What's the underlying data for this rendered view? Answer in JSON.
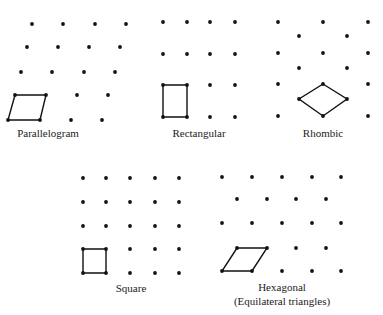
{
  "figure": {
    "panels": [
      {
        "name": "Parallelogram",
        "label": "Parallelogram",
        "label_pos": [
          48,
          137
        ],
        "dots": [
          [
            32,
            24
          ],
          [
            63,
            24
          ],
          [
            95,
            24
          ],
          [
            126,
            24
          ],
          [
            27,
            47
          ],
          [
            58,
            47
          ],
          [
            89,
            47
          ],
          [
            120,
            47
          ],
          [
            21,
            72
          ],
          [
            52,
            72
          ],
          [
            84,
            72
          ],
          [
            115,
            72
          ],
          [
            15,
            95
          ],
          [
            46,
            95
          ],
          [
            77,
            95
          ],
          [
            108,
            95
          ],
          [
            8,
            120
          ],
          [
            40,
            120
          ],
          [
            71,
            120
          ],
          [
            102,
            120
          ]
        ],
        "cell": [
          [
            15,
            95
          ],
          [
            46,
            95
          ],
          [
            40,
            120
          ],
          [
            8,
            120
          ]
        ]
      },
      {
        "name": "Rectangular",
        "label": "Rectangular",
        "label_pos": [
          199,
          137
        ],
        "dots": [
          [
            163,
            22
          ],
          [
            187,
            22
          ],
          [
            210,
            22
          ],
          [
            235,
            22
          ],
          [
            163,
            54
          ],
          [
            187,
            54
          ],
          [
            210,
            54
          ],
          [
            235,
            54
          ],
          [
            163,
            85
          ],
          [
            187,
            85
          ],
          [
            210,
            85
          ],
          [
            235,
            85
          ],
          [
            163,
            117
          ],
          [
            187,
            117
          ],
          [
            210,
            117
          ],
          [
            235,
            117
          ]
        ],
        "cell": [
          [
            163,
            85
          ],
          [
            187,
            85
          ],
          [
            187,
            117
          ],
          [
            163,
            117
          ]
        ]
      },
      {
        "name": "Rhombic",
        "label": "Rhombic",
        "label_pos": [
          323,
          137
        ],
        "dots": [
          [
            278,
            22
          ],
          [
            323,
            22
          ],
          [
            368,
            22
          ],
          [
            299,
            36
          ],
          [
            347,
            36
          ],
          [
            278,
            53
          ],
          [
            323,
            53
          ],
          [
            368,
            53
          ],
          [
            299,
            68
          ],
          [
            347,
            68
          ],
          [
            278,
            84
          ],
          [
            323,
            84
          ],
          [
            368,
            84
          ],
          [
            299,
            99
          ],
          [
            347,
            99
          ],
          [
            278,
            116
          ],
          [
            323,
            116
          ],
          [
            368,
            116
          ]
        ],
        "cell": [
          [
            323,
            84
          ],
          [
            347,
            99
          ],
          [
            323,
            116
          ],
          [
            299,
            99
          ]
        ]
      },
      {
        "name": "Square",
        "label": "Square",
        "label_pos": [
          131,
          292
        ],
        "dots": [
          [
            83,
            178
          ],
          [
            106,
            178
          ],
          [
            130,
            178
          ],
          [
            155,
            178
          ],
          [
            179,
            178
          ],
          [
            83,
            202
          ],
          [
            106,
            202
          ],
          [
            130,
            202
          ],
          [
            155,
            202
          ],
          [
            179,
            202
          ],
          [
            83,
            226
          ],
          [
            106,
            226
          ],
          [
            130,
            226
          ],
          [
            155,
            226
          ],
          [
            179,
            226
          ],
          [
            83,
            249
          ],
          [
            106,
            249
          ],
          [
            130,
            249
          ],
          [
            155,
            249
          ],
          [
            179,
            249
          ],
          [
            83,
            273
          ],
          [
            106,
            273
          ],
          [
            130,
            273
          ],
          [
            155,
            273
          ],
          [
            179,
            273
          ]
        ],
        "cell": [
          [
            83,
            249
          ],
          [
            106,
            249
          ],
          [
            106,
            273
          ],
          [
            83,
            273
          ]
        ]
      },
      {
        "name": "Hexagonal",
        "label": "Hexagonal",
        "label2": "(Equilateral triangles)",
        "label_pos": [
          282,
          291
        ],
        "label2_pos": [
          282,
          305
        ],
        "dots": [
          [
            222,
            177
          ],
          [
            252,
            177
          ],
          [
            282,
            177
          ],
          [
            312,
            177
          ],
          [
            341,
            177
          ],
          [
            237,
            199
          ],
          [
            267,
            199
          ],
          [
            296,
            199
          ],
          [
            326,
            199
          ],
          [
            222,
            223
          ],
          [
            252,
            223
          ],
          [
            282,
            223
          ],
          [
            312,
            223
          ],
          [
            341,
            223
          ],
          [
            237,
            248
          ],
          [
            267,
            248
          ],
          [
            296,
            248
          ],
          [
            326,
            248
          ],
          [
            222,
            271
          ],
          [
            252,
            271
          ],
          [
            282,
            271
          ],
          [
            312,
            271
          ],
          [
            341,
            271
          ]
        ],
        "cell": [
          [
            237,
            248
          ],
          [
            267,
            248
          ],
          [
            252,
            271
          ],
          [
            222,
            271
          ]
        ]
      }
    ]
  }
}
